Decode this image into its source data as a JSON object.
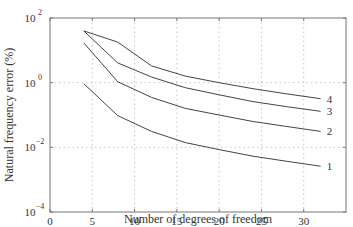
{
  "chart_data": {
    "type": "line",
    "title": "",
    "xlabel": "Number of degrees of freedom",
    "ylabel": "Natural frequency error (%)",
    "xlim": [
      0,
      35
    ],
    "ylim": [
      0.0001,
      100
    ],
    "yscale": "log",
    "grid": true,
    "x_ticks": [
      "0",
      "5",
      "10",
      "15",
      "20",
      "25",
      "30"
    ],
    "y_ticks": [
      "10^-4",
      "10^-2",
      "10^0",
      "10^2"
    ],
    "x": [
      4,
      8,
      12,
      16,
      20,
      24,
      28,
      32
    ],
    "series": [
      {
        "name": "1",
        "values": [
          0.93,
          0.096,
          0.031,
          0.014,
          0.0085,
          0.0053,
          0.0037,
          0.0026
        ]
      },
      {
        "name": "2",
        "values": [
          17,
          1.07,
          0.35,
          0.16,
          0.1,
          0.063,
          0.044,
          0.031
        ]
      },
      {
        "name": "3",
        "values": [
          40,
          4.1,
          1.5,
          0.7,
          0.42,
          0.26,
          0.18,
          0.13
        ]
      },
      {
        "name": "4",
        "values": [
          40,
          18,
          3.3,
          1.6,
          1.0,
          0.65,
          0.45,
          0.32
        ]
      }
    ],
    "legend": "inline labels at right end of curves"
  }
}
